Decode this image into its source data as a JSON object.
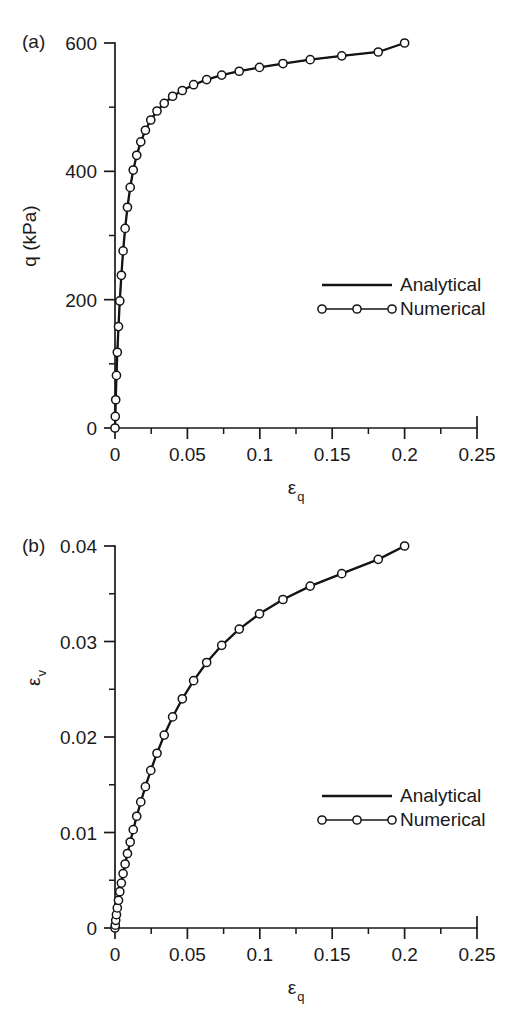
{
  "figure": {
    "background_color": "#ffffff",
    "ink_color": "#141414",
    "panels": [
      "a",
      "b"
    ]
  },
  "chart_data": [
    {
      "id": "panel-a",
      "type": "line",
      "panel_label": "(a)",
      "title": "",
      "xlabel": "ε",
      "xlabel_sub": "q",
      "ylabel": "q (kPa)",
      "ylabel_sub": "",
      "xlim": [
        0,
        0.25
      ],
      "ylim": [
        0,
        600
      ],
      "xticks": [
        0,
        0.05,
        0.1,
        0.15,
        0.2,
        0.25
      ],
      "xticklabels": [
        "0",
        "0.05",
        "0.1",
        "0.15",
        "0.2",
        "0.25"
      ],
      "yticks": [
        0,
        200,
        400,
        600
      ],
      "yticklabels": [
        "0",
        "200",
        "400",
        "600"
      ],
      "xminorticks": [
        0.025,
        0.075,
        0.125,
        0.175,
        0.225
      ],
      "yminorticks": [
        100,
        300,
        500
      ],
      "grid": false,
      "legend_position": "center-right",
      "legend": [
        "Analytical",
        "Numerical"
      ],
      "series": [
        {
          "name": "Analytical",
          "style": "solid-line",
          "x": [
            0,
            0.0002,
            0.0005,
            0.001,
            0.0016,
            0.0024,
            0.0033,
            0.0044,
            0.0056,
            0.007,
            0.0086,
            0.0105,
            0.0126,
            0.015,
            0.0178,
            0.021,
            0.0247,
            0.029,
            0.034,
            0.0398,
            0.0465,
            0.0543,
            0.0633,
            0.0737,
            0.0858,
            0.0998,
            0.116,
            0.1348,
            0.1566,
            0.1818,
            0.2
          ],
          "y": [
            0,
            18,
            44,
            82,
            118,
            158,
            198,
            238,
            276,
            311,
            344,
            375,
            402,
            425,
            446,
            464,
            480,
            494,
            506,
            517,
            526,
            535,
            543,
            550,
            556,
            562,
            568,
            574,
            580,
            586,
            600
          ]
        },
        {
          "name": "Numerical",
          "style": "line-with-open-circles",
          "marker": "open-circle",
          "x": [
            0,
            0.0002,
            0.0005,
            0.001,
            0.0016,
            0.0024,
            0.0033,
            0.0044,
            0.0056,
            0.007,
            0.0086,
            0.0105,
            0.0126,
            0.015,
            0.0178,
            0.021,
            0.0247,
            0.029,
            0.034,
            0.0398,
            0.0465,
            0.0543,
            0.0633,
            0.0737,
            0.0858,
            0.0998,
            0.116,
            0.1348,
            0.1566,
            0.1818,
            0.2
          ],
          "y": [
            0,
            18,
            44,
            82,
            118,
            158,
            198,
            238,
            276,
            311,
            344,
            375,
            402,
            425,
            446,
            464,
            480,
            494,
            506,
            517,
            526,
            535,
            543,
            550,
            556,
            562,
            568,
            574,
            580,
            586,
            600
          ]
        }
      ]
    },
    {
      "id": "panel-b",
      "type": "line",
      "panel_label": "(b)",
      "title": "",
      "xlabel": "ε",
      "xlabel_sub": "q",
      "ylabel": "ε",
      "ylabel_sub": "v",
      "xlim": [
        0,
        0.25
      ],
      "ylim": [
        0,
        0.04
      ],
      "xticks": [
        0,
        0.05,
        0.1,
        0.15,
        0.2,
        0.25
      ],
      "xticklabels": [
        "0",
        "0.05",
        "0.1",
        "0.15",
        "0.2",
        "0.25"
      ],
      "yticks": [
        0,
        0.01,
        0.02,
        0.03,
        0.04
      ],
      "yticklabels": [
        "0",
        "0.01",
        "0.02",
        "0.03",
        "0.04"
      ],
      "xminorticks": [
        0.025,
        0.075,
        0.125,
        0.175,
        0.225
      ],
      "yminorticks": [
        0.005,
        0.015,
        0.025,
        0.035
      ],
      "grid": false,
      "legend_position": "center-right",
      "legend": [
        "Analytical",
        "Numerical"
      ],
      "series": [
        {
          "name": "Analytical",
          "style": "solid-line",
          "x": [
            0,
            0.0002,
            0.0005,
            0.001,
            0.0016,
            0.0024,
            0.0033,
            0.0044,
            0.0056,
            0.007,
            0.0086,
            0.0105,
            0.0126,
            0.015,
            0.0178,
            0.021,
            0.0247,
            0.029,
            0.034,
            0.0398,
            0.0465,
            0.0543,
            0.0633,
            0.0737,
            0.0858,
            0.0998,
            0.116,
            0.1348,
            0.1566,
            0.1818,
            0.2
          ],
          "y": [
            0,
            0.0003,
            0.0008,
            0.0014,
            0.0021,
            0.0029,
            0.0038,
            0.0047,
            0.0057,
            0.0067,
            0.0078,
            0.009,
            0.0103,
            0.0117,
            0.0132,
            0.0148,
            0.0165,
            0.0183,
            0.0202,
            0.0221,
            0.024,
            0.0259,
            0.0278,
            0.0296,
            0.0313,
            0.0329,
            0.0344,
            0.0358,
            0.0371,
            0.0386,
            0.04
          ]
        },
        {
          "name": "Numerical",
          "style": "line-with-open-circles",
          "marker": "open-circle",
          "x": [
            0,
            0.0002,
            0.0005,
            0.001,
            0.0016,
            0.0024,
            0.0033,
            0.0044,
            0.0056,
            0.007,
            0.0086,
            0.0105,
            0.0126,
            0.015,
            0.0178,
            0.021,
            0.0247,
            0.029,
            0.034,
            0.0398,
            0.0465,
            0.0543,
            0.0633,
            0.0737,
            0.0858,
            0.0998,
            0.116,
            0.1348,
            0.1566,
            0.1818,
            0.2
          ],
          "y": [
            0,
            0.0003,
            0.0008,
            0.0014,
            0.0021,
            0.0029,
            0.0038,
            0.0047,
            0.0057,
            0.0067,
            0.0078,
            0.009,
            0.0103,
            0.0117,
            0.0132,
            0.0148,
            0.0165,
            0.0183,
            0.0202,
            0.0221,
            0.024,
            0.0259,
            0.0278,
            0.0296,
            0.0313,
            0.0329,
            0.0344,
            0.0358,
            0.0371,
            0.0386,
            0.04
          ]
        }
      ]
    }
  ]
}
